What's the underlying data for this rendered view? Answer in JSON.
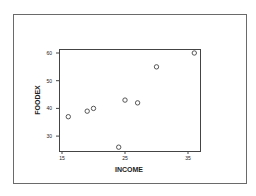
{
  "chart_data": {
    "type": "scatter",
    "title": "",
    "xlabel": "INCOME",
    "ylabel": "FOODEX",
    "xlim": [
      14.5,
      37.2
    ],
    "ylim": [
      24.7,
      61.5
    ],
    "x_ticks": [
      15,
      25,
      35
    ],
    "y_ticks": [
      30,
      40,
      50,
      60
    ],
    "grid": false,
    "legend": null,
    "marker": "open-circle",
    "points": [
      {
        "x": 16,
        "y": 37
      },
      {
        "x": 19,
        "y": 39
      },
      {
        "x": 20,
        "y": 40
      },
      {
        "x": 24,
        "y": 26
      },
      {
        "x": 25,
        "y": 43
      },
      {
        "x": 27,
        "y": 42
      },
      {
        "x": 30,
        "y": 55
      },
      {
        "x": 36,
        "y": 60
      }
    ]
  },
  "colors": {
    "frame": "#6a6a6a",
    "axis": "#333333",
    "marker": "#444444",
    "background": "#ffffff"
  }
}
